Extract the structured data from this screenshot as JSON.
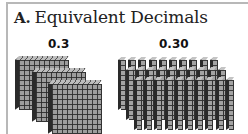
{
  "section": {
    "letter": "A.",
    "title": "Equivalent Decimals"
  },
  "models": [
    {
      "label": "0.3",
      "representation": "3 hundred-square flats (3 tenths)",
      "count": 3
    },
    {
      "label": "0.30",
      "representation": "30 ten-rods (30 hundredths)",
      "count": 30
    }
  ]
}
